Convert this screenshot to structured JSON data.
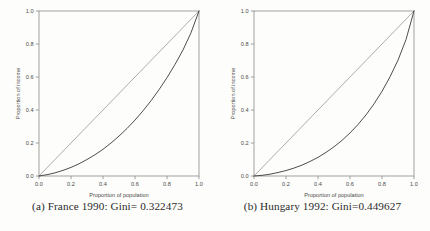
{
  "figure": {
    "background_color": "#fdfdfb",
    "axis_color": "#8a8a8a",
    "diagonal_color": "#8a8a8a",
    "curve_color": "#3a3a3a",
    "text_color": "#4a4a4a",
    "caption_color": "#2b2b2b"
  },
  "panels": [
    {
      "id": "panel-a",
      "caption": "(a) France 1990: Gini= 0.322473",
      "country": "France",
      "year": "1990",
      "gini": "0.322473"
    },
    {
      "id": "panel-b",
      "caption": "(b) Hungary 1992: Gini=0.449627",
      "country": "Hungary",
      "year": "1992",
      "gini": "0.449627"
    }
  ],
  "chart_data": [
    {
      "type": "line",
      "title": "(a) France 1990: Gini= 0.322473",
      "xlabel": "Proportion of population",
      "ylabel": "Proportion of income",
      "xlim": [
        0.0,
        1.0
      ],
      "ylim": [
        0.0,
        1.0
      ],
      "xticks": [
        "0.0",
        "0.2",
        "0.4",
        "0.6",
        "0.8",
        "1.0"
      ],
      "yticks": [
        "0.0",
        "0.2",
        "0.4",
        "0.6",
        "0.8",
        "1.0"
      ],
      "xtick_values": [
        0.0,
        0.2,
        0.4,
        0.6,
        0.8,
        1.0
      ],
      "ytick_values": [
        0.0,
        0.2,
        0.4,
        0.6,
        0.8,
        1.0
      ],
      "grid": false,
      "legend": "none",
      "gini": 0.322473,
      "series": [
        {
          "name": "line-of-equality",
          "style": "straight-diagonal",
          "x": [
            0.0,
            1.0
          ],
          "values": [
            0.0,
            1.0
          ]
        },
        {
          "name": "lorenz-curve-france-1990",
          "style": "curve",
          "x": [
            0.0,
            0.05,
            0.1,
            0.15,
            0.2,
            0.25,
            0.3,
            0.35,
            0.4,
            0.45,
            0.5,
            0.55,
            0.6,
            0.65,
            0.7,
            0.75,
            0.8,
            0.85,
            0.9,
            0.95,
            1.0
          ],
          "values": [
            0.0,
            0.008,
            0.019,
            0.034,
            0.052,
            0.074,
            0.1,
            0.129,
            0.162,
            0.2,
            0.242,
            0.288,
            0.339,
            0.395,
            0.456,
            0.523,
            0.596,
            0.676,
            0.764,
            0.868,
            1.0
          ]
        }
      ]
    },
    {
      "type": "line",
      "title": "(b) Hungary 1992: Gini=0.449627",
      "xlabel": "Proportion of population",
      "ylabel": "Proportion of income",
      "xlim": [
        0.0,
        1.0
      ],
      "ylim": [
        0.0,
        1.0
      ],
      "xticks": [
        "0.0",
        "0.2",
        "0.4",
        "0.6",
        "0.8",
        "1.0"
      ],
      "yticks": [
        "0.0",
        "0.2",
        "0.4",
        "0.6",
        "0.8",
        "1.0"
      ],
      "xtick_values": [
        0.0,
        0.2,
        0.4,
        0.6,
        0.8,
        1.0
      ],
      "ytick_values": [
        0.0,
        0.2,
        0.4,
        0.6,
        0.8,
        1.0
      ],
      "grid": false,
      "legend": "none",
      "gini": 0.449627,
      "series": [
        {
          "name": "line-of-equality",
          "style": "straight-diagonal",
          "x": [
            0.0,
            1.0
          ],
          "values": [
            0.0,
            1.0
          ]
        },
        {
          "name": "lorenz-curve-hungary-1992",
          "style": "curve",
          "x": [
            0.0,
            0.05,
            0.1,
            0.15,
            0.2,
            0.25,
            0.3,
            0.35,
            0.4,
            0.45,
            0.5,
            0.55,
            0.6,
            0.65,
            0.7,
            0.75,
            0.8,
            0.85,
            0.9,
            0.95,
            1.0
          ],
          "values": [
            0.0,
            0.004,
            0.011,
            0.021,
            0.033,
            0.048,
            0.066,
            0.088,
            0.113,
            0.143,
            0.177,
            0.216,
            0.261,
            0.312,
            0.37,
            0.437,
            0.513,
            0.601,
            0.702,
            0.827,
            1.0
          ]
        }
      ]
    }
  ]
}
